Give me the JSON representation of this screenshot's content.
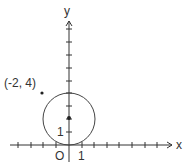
{
  "diagram": {
    "type": "coordinate-plane",
    "axes": {
      "x_label": "x",
      "y_label": "y",
      "origin_label": "O",
      "x_tick_label": "1",
      "y_tick_label": "1",
      "x_range": [
        -4,
        8
      ],
      "y_range": [
        -1,
        9
      ]
    },
    "circle": {
      "center": [
        0,
        2
      ],
      "radius": 2
    },
    "points": [
      {
        "label": "(-2, 4)",
        "x": -2,
        "y": 4
      },
      {
        "label": "",
        "x": 0,
        "y": 2
      }
    ],
    "colors": {
      "axis": "#333333",
      "circle": "#444444",
      "text": "#333333",
      "background": "#ffffff"
    }
  }
}
